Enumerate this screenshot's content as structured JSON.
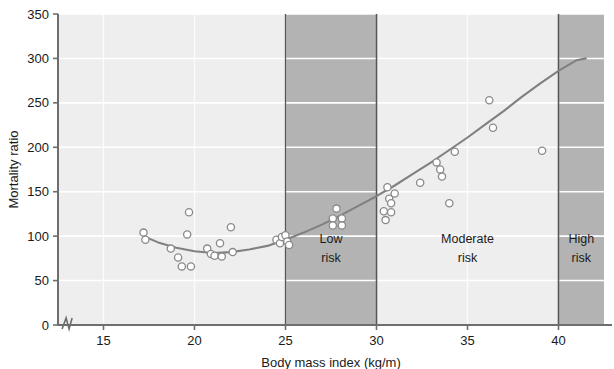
{
  "chart_data": {
    "type": "scatter",
    "title": "",
    "xlabel": "Body mass index (kg/m)",
    "ylabel": "Mortality ratio",
    "xlim": [
      12.5,
      42.5
    ],
    "ylim": [
      0,
      350
    ],
    "xticks": [
      15,
      20,
      25,
      30,
      35,
      40
    ],
    "xtick_labels": [
      "15",
      "20",
      "25",
      "30",
      "35",
      "40"
    ],
    "yticks": [
      0,
      50,
      100,
      150,
      200,
      250,
      300,
      350
    ],
    "ytick_labels": [
      "0",
      "50",
      "100",
      "150",
      "200",
      "250",
      "300",
      "350"
    ],
    "grid": true,
    "axis_break_x": 13.0,
    "legend": "none",
    "marker": "open-circle",
    "points": [
      {
        "x": 17.2,
        "y": 104
      },
      {
        "x": 17.3,
        "y": 96
      },
      {
        "x": 18.7,
        "y": 86
      },
      {
        "x": 19.1,
        "y": 76
      },
      {
        "x": 19.3,
        "y": 66
      },
      {
        "x": 19.8,
        "y": 66
      },
      {
        "x": 19.7,
        "y": 127
      },
      {
        "x": 19.6,
        "y": 102
      },
      {
        "x": 20.7,
        "y": 86
      },
      {
        "x": 20.9,
        "y": 80
      },
      {
        "x": 21.1,
        "y": 78
      },
      {
        "x": 21.4,
        "y": 92
      },
      {
        "x": 21.5,
        "y": 77
      },
      {
        "x": 22.0,
        "y": 110
      },
      {
        "x": 22.1,
        "y": 82
      },
      {
        "x": 24.5,
        "y": 96
      },
      {
        "x": 24.7,
        "y": 92
      },
      {
        "x": 24.8,
        "y": 99
      },
      {
        "x": 25.0,
        "y": 101
      },
      {
        "x": 25.1,
        "y": 94
      },
      {
        "x": 25.2,
        "y": 90
      },
      {
        "x": 27.8,
        "y": 131
      },
      {
        "x": 27.6,
        "y": 120
      },
      {
        "x": 28.1,
        "y": 120
      },
      {
        "x": 27.6,
        "y": 112
      },
      {
        "x": 28.1,
        "y": 112
      },
      {
        "x": 30.4,
        "y": 128
      },
      {
        "x": 30.6,
        "y": 155
      },
      {
        "x": 30.7,
        "y": 142
      },
      {
        "x": 30.8,
        "y": 137
      },
      {
        "x": 30.8,
        "y": 127
      },
      {
        "x": 30.5,
        "y": 118
      },
      {
        "x": 31.0,
        "y": 148
      },
      {
        "x": 32.4,
        "y": 160
      },
      {
        "x": 33.3,
        "y": 183
      },
      {
        "x": 33.5,
        "y": 175
      },
      {
        "x": 33.6,
        "y": 167
      },
      {
        "x": 34.0,
        "y": 137
      },
      {
        "x": 34.3,
        "y": 195
      },
      {
        "x": 36.2,
        "y": 253
      },
      {
        "x": 36.4,
        "y": 222
      },
      {
        "x": 39.1,
        "y": 196
      }
    ],
    "fitted_curve": [
      {
        "x": 17.2,
        "y": 100
      },
      {
        "x": 18.0,
        "y": 93
      },
      {
        "x": 19.0,
        "y": 87
      },
      {
        "x": 20.0,
        "y": 83
      },
      {
        "x": 21.0,
        "y": 81
      },
      {
        "x": 22.0,
        "y": 82
      },
      {
        "x": 23.0,
        "y": 85
      },
      {
        "x": 24.0,
        "y": 89
      },
      {
        "x": 25.0,
        "y": 96
      },
      {
        "x": 26.0,
        "y": 104
      },
      {
        "x": 27.0,
        "y": 113
      },
      {
        "x": 28.0,
        "y": 123
      },
      {
        "x": 29.0,
        "y": 134
      },
      {
        "x": 30.0,
        "y": 145
      },
      {
        "x": 31.0,
        "y": 157
      },
      {
        "x": 32.0,
        "y": 170
      },
      {
        "x": 33.0,
        "y": 183
      },
      {
        "x": 34.0,
        "y": 197
      },
      {
        "x": 35.0,
        "y": 211
      },
      {
        "x": 36.0,
        "y": 226
      },
      {
        "x": 37.0,
        "y": 241
      },
      {
        "x": 38.0,
        "y": 257
      },
      {
        "x": 39.0,
        "y": 272
      },
      {
        "x": 40.0,
        "y": 286
      },
      {
        "x": 41.0,
        "y": 298
      },
      {
        "x": 41.5,
        "y": 300
      }
    ],
    "bands": [
      {
        "name": "low-risk",
        "label_line1": "Low",
        "label_line2": "risk",
        "x0": 25,
        "x1": 30,
        "shade": "dark"
      },
      {
        "name": "moderate-risk",
        "label_line1": "Moderate",
        "label_line2": "risk",
        "x0": 30,
        "x1": 40,
        "shade": "light"
      },
      {
        "name": "high-risk",
        "label_line1": "High",
        "label_line2": "risk",
        "x0": 40,
        "x1": 42.5,
        "shade": "dark"
      }
    ]
  },
  "colors": {
    "plot_background": "#eeeeee",
    "band_dark": "#b3b3b3",
    "band_light": "#eeeeee",
    "gridline": "#ffffff",
    "axis": "#6e6e6e",
    "curve": "#808080",
    "marker_stroke": "#8a8a8a",
    "marker_fill": "#ffffff",
    "text": "#1a1a1a"
  }
}
